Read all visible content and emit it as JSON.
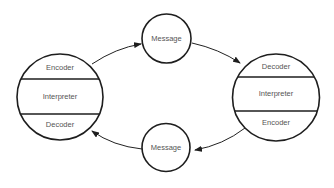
{
  "diagram": {
    "type": "communication-model",
    "colors": {
      "stroke": "#1e1e1e",
      "text": "#555555",
      "background": "#ffffff"
    },
    "nodes": {
      "left_party": {
        "sections": [
          {
            "label": "Encoder"
          },
          {
            "label": "Interpreter"
          },
          {
            "label": "Decoder"
          }
        ]
      },
      "right_party": {
        "sections": [
          {
            "label": "Decoder"
          },
          {
            "label": "Interpreter"
          },
          {
            "label": "Encoder"
          }
        ]
      },
      "top_message": {
        "label": "Message"
      },
      "bottom_message": {
        "label": "Message"
      }
    },
    "edges": [
      {
        "from": "left_party.Encoder",
        "to": "top_message"
      },
      {
        "from": "top_message",
        "to": "right_party.Decoder"
      },
      {
        "from": "right_party.Encoder",
        "to": "bottom_message"
      },
      {
        "from": "bottom_message",
        "to": "left_party.Decoder"
      }
    ]
  }
}
